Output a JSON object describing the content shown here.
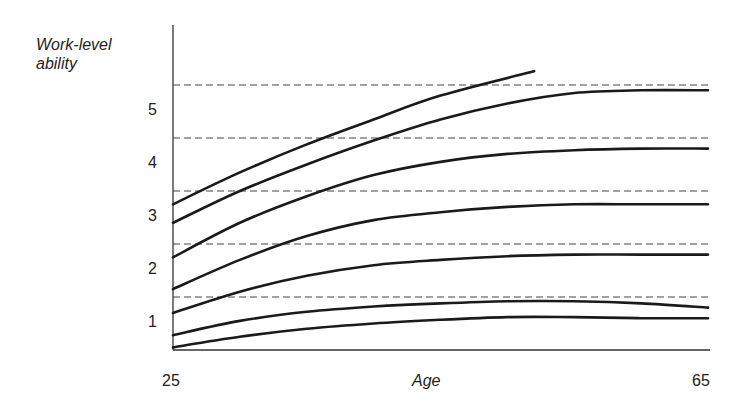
{
  "chart_data": {
    "type": "line",
    "title": "",
    "xlabel": "Age",
    "ylabel": "Work-level ability",
    "ylabel_lines": [
      "Work-level",
      "ability"
    ],
    "xlim": [
      25,
      65
    ],
    "ylim": [
      0.5,
      6.0
    ],
    "x_ticks": [
      "25",
      "65"
    ],
    "y_ticks": [
      "1",
      "2",
      "3",
      "4",
      "5"
    ],
    "grid": "dashed horizontal lines at level boundaries",
    "dashed_lines": [
      1.5,
      2.5,
      3.5,
      4.5,
      5.5
    ],
    "series": [
      {
        "name": "curve-1",
        "x": [
          25,
          30,
          35,
          40,
          45,
          52
        ],
        "values": [
          3.25,
          3.85,
          4.38,
          4.85,
          5.3,
          5.76
        ]
      },
      {
        "name": "curve-2",
        "x": [
          25,
          30,
          35,
          40,
          45,
          50,
          55,
          60,
          65
        ],
        "values": [
          2.9,
          3.5,
          4.0,
          4.45,
          4.85,
          5.15,
          5.35,
          5.4,
          5.4
        ]
      },
      {
        "name": "curve-3",
        "x": [
          25,
          30,
          35,
          40,
          45,
          50,
          55,
          60,
          65
        ],
        "values": [
          2.25,
          2.9,
          3.4,
          3.8,
          4.05,
          4.2,
          4.27,
          4.3,
          4.3
        ]
      },
      {
        "name": "curve-4",
        "x": [
          25,
          30,
          35,
          40,
          45,
          50,
          55,
          60,
          65
        ],
        "values": [
          1.65,
          2.2,
          2.65,
          2.95,
          3.1,
          3.2,
          3.25,
          3.25,
          3.25
        ]
      },
      {
        "name": "curve-5",
        "x": [
          25,
          30,
          35,
          40,
          45,
          50,
          55,
          60,
          65
        ],
        "values": [
          1.2,
          1.6,
          1.9,
          2.1,
          2.2,
          2.27,
          2.3,
          2.3,
          2.3
        ]
      },
      {
        "name": "curve-6",
        "x": [
          25,
          30,
          35,
          40,
          45,
          50,
          55,
          60,
          65
        ],
        "values": [
          0.78,
          1.05,
          1.22,
          1.32,
          1.38,
          1.42,
          1.42,
          1.38,
          1.3
        ]
      },
      {
        "name": "curve-7",
        "x": [
          25,
          30,
          35,
          40,
          45,
          50,
          55,
          60,
          65
        ],
        "values": [
          0.55,
          0.75,
          0.9,
          1.0,
          1.07,
          1.12,
          1.12,
          1.1,
          1.1
        ]
      }
    ]
  }
}
